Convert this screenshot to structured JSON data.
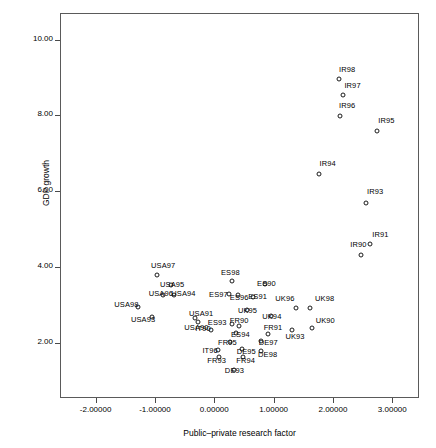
{
  "chart_data": {
    "type": "scatter",
    "title": "",
    "xlabel": "Public–private research factor",
    "ylabel": "GDP growth",
    "xlim": [
      -2.6,
      3.45
    ],
    "ylim": [
      0.55,
      10.7
    ],
    "grid": false,
    "legend": "none",
    "xticks": [
      "-2.00000",
      "-1.00000",
      "0.00000",
      "1.00000",
      "2.00000",
      "3.00000"
    ],
    "xtick_values": [
      -2,
      -1,
      0,
      1,
      2,
      3
    ],
    "yticks": [
      "10.00",
      "8.00",
      "6.00",
      "4.00",
      "2.00"
    ],
    "ytick_values": [
      10,
      8,
      6,
      4,
      2
    ],
    "marker": "open-circle",
    "points": [
      {
        "label": "IR98",
        "x": 2.1,
        "y": 8.95,
        "lx": 2.24,
        "ly": 9.22
      },
      {
        "label": "IR97",
        "x": 2.17,
        "y": 8.53,
        "lx": 2.33,
        "ly": 8.81
      },
      {
        "label": "IR96",
        "x": 2.12,
        "y": 7.98,
        "lx": 2.24,
        "ly": 8.28
      },
      {
        "label": "IR95",
        "x": 2.74,
        "y": 7.58,
        "lx": 2.9,
        "ly": 7.88
      },
      {
        "label": "IR94",
        "x": 1.76,
        "y": 6.45,
        "lx": 1.91,
        "ly": 6.75
      },
      {
        "label": "IR93",
        "x": 2.55,
        "y": 5.7,
        "lx": 2.71,
        "ly": 6.0
      },
      {
        "label": "IR91",
        "x": 2.63,
        "y": 4.6,
        "lx": 2.8,
        "ly": 4.88
      },
      {
        "label": "IR90",
        "x": 2.48,
        "y": 4.33,
        "lx": 2.43,
        "ly": 4.6
      },
      {
        "label": "USA97",
        "x": -0.96,
        "y": 3.78,
        "lx": -0.86,
        "ly": 4.06
      },
      {
        "label": "USA95",
        "x": -0.73,
        "y": 3.54,
        "lx": -0.71,
        "ly": 3.56
      },
      {
        "label": "USA96",
        "x": -0.86,
        "y": 3.26,
        "lx": -0.9,
        "ly": 3.31
      },
      {
        "label": "USA94",
        "x": -0.68,
        "y": 3.26,
        "lx": -0.52,
        "ly": 3.31
      },
      {
        "label": "USA98",
        "x": -1.28,
        "y": 2.96,
        "lx": -1.48,
        "ly": 3.02
      },
      {
        "label": "USA93",
        "x": -1.05,
        "y": 2.69,
        "lx": -1.2,
        "ly": 2.62
      },
      {
        "label": "USA91",
        "x": -0.32,
        "y": 2.66,
        "lx": -0.22,
        "ly": 2.8
      },
      {
        "label": "USA90",
        "x": -0.27,
        "y": 2.56,
        "lx": -0.3,
        "ly": 2.43
      },
      {
        "label": "ES98",
        "x": 0.3,
        "y": 3.63,
        "lx": 0.27,
        "ly": 3.88
      },
      {
        "label": "ES90",
        "x": 0.86,
        "y": 3.56,
        "lx": 0.88,
        "ly": 3.59
      },
      {
        "label": "ES97",
        "x": 0.24,
        "y": 3.28,
        "lx": 0.07,
        "ly": 3.3
      },
      {
        "label": "ES96",
        "x": 0.4,
        "y": 3.26,
        "lx": 0.42,
        "ly": 3.22
      },
      {
        "label": "ES91",
        "x": 0.66,
        "y": 3.22,
        "lx": 0.73,
        "ly": 3.24
      },
      {
        "label": "UK96",
        "x": 1.37,
        "y": 2.93,
        "lx": 1.19,
        "ly": 3.19
      },
      {
        "label": "UK98",
        "x": 1.62,
        "y": 2.93,
        "lx": 1.86,
        "ly": 3.18
      },
      {
        "label": "UK95",
        "x": 0.55,
        "y": 2.87,
        "lx": 0.56,
        "ly": 2.88
      },
      {
        "label": "UK94",
        "x": 0.95,
        "y": 2.72,
        "lx": 0.97,
        "ly": 2.7
      },
      {
        "label": "UK90",
        "x": 1.64,
        "y": 2.4,
        "lx": 1.87,
        "ly": 2.6
      },
      {
        "label": "UK93",
        "x": 1.31,
        "y": 2.35,
        "lx": 1.36,
        "ly": 2.19
      },
      {
        "label": "ES93",
        "x": 0.3,
        "y": 2.51,
        "lx": 0.05,
        "ly": 2.55
      },
      {
        "label": "FR90",
        "x": 0.41,
        "y": 2.46,
        "lx": 0.42,
        "ly": 2.6
      },
      {
        "label": "IT90",
        "x": -0.06,
        "y": 2.33,
        "lx": -0.19,
        "ly": 2.4
      },
      {
        "label": "ES94",
        "x": 0.37,
        "y": 2.27,
        "lx": 0.44,
        "ly": 2.24
      },
      {
        "label": "FR91",
        "x": 0.91,
        "y": 2.25,
        "lx": 0.99,
        "ly": 2.42
      },
      {
        "label": "FR95",
        "x": 0.26,
        "y": 2.02,
        "lx": 0.22,
        "ly": 2.02
      },
      {
        "label": "DE97",
        "x": 0.78,
        "y": 2.04,
        "lx": 0.91,
        "ly": 2.03
      },
      {
        "label": "DE95",
        "x": 0.46,
        "y": 1.84,
        "lx": 0.54,
        "ly": 1.8
      },
      {
        "label": "IT96",
        "x": 0.07,
        "y": 1.82,
        "lx": -0.07,
        "ly": 1.81
      },
      {
        "label": "DE98",
        "x": 0.79,
        "y": 1.78,
        "lx": 0.9,
        "ly": 1.72
      },
      {
        "label": "FR93",
        "x": 0.08,
        "y": 1.63,
        "lx": 0.04,
        "ly": 1.56
      },
      {
        "label": "FR94",
        "x": 0.49,
        "y": 1.63,
        "lx": 0.53,
        "ly": 1.56
      },
      {
        "label": "DE93",
        "x": 0.33,
        "y": 1.3,
        "lx": 0.34,
        "ly": 1.28
      }
    ]
  }
}
